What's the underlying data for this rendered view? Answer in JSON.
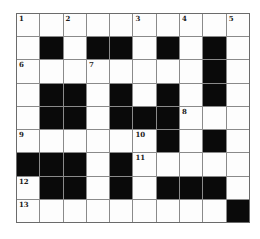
{
  "puzzle": {
    "type": "crossword-grid",
    "rows": 9,
    "cols": 10,
    "black_cells": [
      [
        1,
        1
      ],
      [
        1,
        3
      ],
      [
        1,
        4
      ],
      [
        1,
        6
      ],
      [
        1,
        8
      ],
      [
        2,
        8
      ],
      [
        3,
        1
      ],
      [
        3,
        2
      ],
      [
        3,
        4
      ],
      [
        3,
        6
      ],
      [
        3,
        8
      ],
      [
        4,
        1
      ],
      [
        4,
        2
      ],
      [
        4,
        4
      ],
      [
        4,
        5
      ],
      [
        4,
        6
      ],
      [
        5,
        6
      ],
      [
        5,
        8
      ],
      [
        6,
        0
      ],
      [
        6,
        1
      ],
      [
        6,
        2
      ],
      [
        6,
        4
      ],
      [
        7,
        1
      ],
      [
        7,
        2
      ],
      [
        7,
        4
      ],
      [
        7,
        6
      ],
      [
        7,
        7
      ],
      [
        7,
        8
      ],
      [
        8,
        9
      ]
    ],
    "numbers": [
      {
        "row": 0,
        "col": 0,
        "label": "1"
      },
      {
        "row": 0,
        "col": 2,
        "label": "2"
      },
      {
        "row": 0,
        "col": 5,
        "label": "3"
      },
      {
        "row": 0,
        "col": 7,
        "label": "4"
      },
      {
        "row": 0,
        "col": 9,
        "label": "5"
      },
      {
        "row": 2,
        "col": 0,
        "label": "6"
      },
      {
        "row": 2,
        "col": 3,
        "label": "7"
      },
      {
        "row": 4,
        "col": 7,
        "label": "8"
      },
      {
        "row": 5,
        "col": 0,
        "label": "9"
      },
      {
        "row": 5,
        "col": 5,
        "label": "10"
      },
      {
        "row": 6,
        "col": 5,
        "label": "11"
      },
      {
        "row": 7,
        "col": 0,
        "label": "12"
      },
      {
        "row": 8,
        "col": 0,
        "label": "13"
      }
    ],
    "colors": {
      "page_background": "#ffffff",
      "white_cell": "#fdfdfd",
      "black_cell": "#0a0a0a",
      "grid_line": "#8a8a8a",
      "outer_border": "#6b6b6b",
      "number_text": "#1a1a1a"
    }
  }
}
